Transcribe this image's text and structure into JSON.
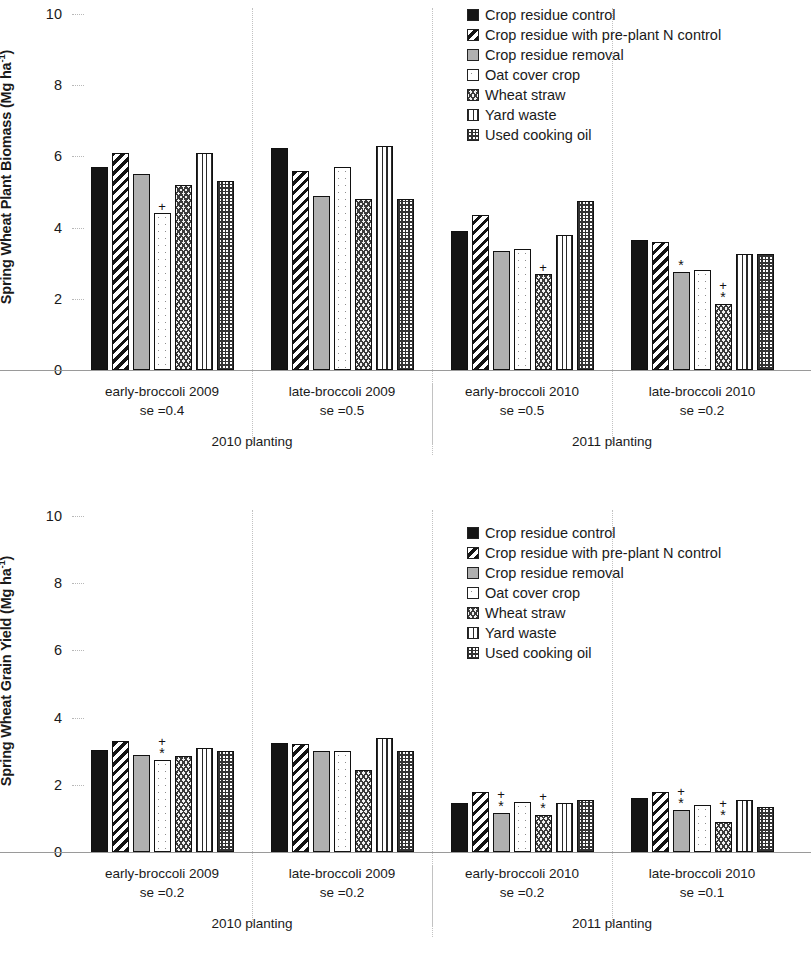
{
  "legend": {
    "items": [
      {
        "label": "Crop residue control",
        "pattern": "p-solid-black",
        "icon": "legend-swatch-solid-black"
      },
      {
        "label": "Crop residue with pre-plant N control",
        "pattern": "p-diag",
        "icon": "legend-swatch-diagonal-hatch"
      },
      {
        "label": "Crop residue removal",
        "pattern": "p-gray",
        "icon": "legend-swatch-solid-gray"
      },
      {
        "label": "Oat cover crop",
        "pattern": "p-open",
        "icon": "legend-swatch-open"
      },
      {
        "label": "Wheat straw",
        "pattern": "p-wave",
        "icon": "legend-swatch-wave"
      },
      {
        "label": "Yard waste",
        "pattern": "p-vert",
        "icon": "legend-swatch-vertical-lines"
      },
      {
        "label": "Used cooking oil",
        "pattern": "p-check",
        "icon": "legend-swatch-checkerboard"
      }
    ]
  },
  "charts": [
    {
      "id": "plant-biomass",
      "ylabel": "Spring Wheat Plant Biomass (Mg ha",
      "ylabel_sup": "-1",
      "ylabel_tail": ")",
      "yticks": [
        10,
        8,
        6,
        4,
        2,
        0
      ],
      "groups": [
        {
          "label": "early-broccoli 2009",
          "se": "se =0.4"
        },
        {
          "label": "late-broccoli 2009",
          "se": "se =0.5"
        },
        {
          "label": "early-broccoli 2010",
          "se": "se =0.5"
        },
        {
          "label": "late-broccoli 2010",
          "se": "se =0.2"
        }
      ],
      "seasons": [
        "2010 planting",
        "2011 planting"
      ]
    },
    {
      "id": "grain-yield",
      "ylabel": "Spring Wheat Grain Yield (Mg ha",
      "ylabel_sup": "-1",
      "ylabel_tail": ")",
      "yticks": [
        10,
        8,
        6,
        4,
        2,
        0
      ],
      "groups": [
        {
          "label": "early-broccoli 2009",
          "se": "se =0.2"
        },
        {
          "label": "late-broccoli 2009",
          "se": "se =0.2"
        },
        {
          "label": "early-broccoli 2010",
          "se": "se =0.2"
        },
        {
          "label": "late-broccoli 2010",
          "se": "se =0.1"
        }
      ],
      "seasons": [
        "2010 planting",
        "2011 planting"
      ]
    }
  ],
  "chart_data": [
    {
      "type": "bar",
      "title": "Spring Wheat Plant Biomass",
      "ylabel": "Spring Wheat Plant Biomass (Mg ha-1)",
      "xlabel": "",
      "ylim": [
        0,
        10
      ],
      "yticks": [
        0,
        2,
        4,
        6,
        8,
        10
      ],
      "grid": true,
      "legend_position": "top-right",
      "categories": [
        "early-broccoli 2009",
        "late-broccoli 2009",
        "early-broccoli 2010",
        "late-broccoli 2010"
      ],
      "category_se": [
        0.4,
        0.5,
        0.5,
        0.2
      ],
      "category_groups": [
        "2010 planting",
        "2010 planting",
        "2011 planting",
        "2011 planting"
      ],
      "series": [
        {
          "name": "Crop residue control",
          "values": [
            5.7,
            6.25,
            3.9,
            3.65
          ]
        },
        {
          "name": "Crop residue with pre-plant N control",
          "values": [
            6.1,
            5.6,
            4.35,
            3.6
          ]
        },
        {
          "name": "Crop residue removal",
          "values": [
            5.5,
            4.9,
            3.35,
            2.75
          ]
        },
        {
          "name": "Oat cover crop",
          "values": [
            4.4,
            5.7,
            3.4,
            2.8
          ]
        },
        {
          "name": "Wheat straw",
          "values": [
            5.2,
            4.8,
            2.7,
            1.85
          ]
        },
        {
          "name": "Yard waste",
          "values": [
            6.1,
            6.3,
            3.8,
            3.25
          ]
        },
        {
          "name": "Used cooking oil",
          "values": [
            5.3,
            4.8,
            4.75,
            3.25
          ]
        }
      ],
      "annotations": [
        {
          "category": "early-broccoli 2009",
          "series": "Oat cover crop",
          "marks": [
            "+"
          ]
        },
        {
          "category": "early-broccoli 2010",
          "series": "Wheat straw",
          "marks": [
            "+"
          ]
        },
        {
          "category": "late-broccoli 2010",
          "series": "Crop residue removal",
          "marks": [
            "*"
          ]
        },
        {
          "category": "late-broccoli 2010",
          "series": "Wheat straw",
          "marks": [
            "+",
            "*"
          ]
        }
      ]
    },
    {
      "type": "bar",
      "title": "Spring Wheat Grain Yield",
      "ylabel": "Spring Wheat Grain Yield (Mg ha-1)",
      "xlabel": "",
      "ylim": [
        0,
        10
      ],
      "yticks": [
        0,
        2,
        4,
        6,
        8,
        10
      ],
      "grid": true,
      "legend_position": "top-right",
      "categories": [
        "early-broccoli 2009",
        "late-broccoli 2009",
        "early-broccoli 2010",
        "late-broccoli 2010"
      ],
      "category_se": [
        0.2,
        0.2,
        0.2,
        0.1
      ],
      "category_groups": [
        "2010 planting",
        "2010 planting",
        "2011 planting",
        "2011 planting"
      ],
      "series": [
        {
          "name": "Crop residue control",
          "values": [
            3.05,
            3.25,
            1.45,
            1.6
          ]
        },
        {
          "name": "Crop residue with pre-plant N control",
          "values": [
            3.3,
            3.2,
            1.8,
            1.8
          ]
        },
        {
          "name": "Crop residue removal",
          "values": [
            2.9,
            3.0,
            1.15,
            1.25
          ]
        },
        {
          "name": "Oat cover crop",
          "values": [
            2.75,
            3.0,
            1.5,
            1.4
          ]
        },
        {
          "name": "Wheat straw",
          "values": [
            2.85,
            2.45,
            1.1,
            0.9
          ]
        },
        {
          "name": "Yard waste",
          "values": [
            3.1,
            3.4,
            1.45,
            1.55
          ]
        },
        {
          "name": "Used cooking oil",
          "values": [
            3.0,
            3.0,
            1.55,
            1.35
          ]
        }
      ],
      "annotations": [
        {
          "category": "early-broccoli 2009",
          "series": "Oat cover crop",
          "marks": [
            "+",
            "*"
          ]
        },
        {
          "category": "early-broccoli 2010",
          "series": "Crop residue removal",
          "marks": [
            "+",
            "*"
          ]
        },
        {
          "category": "early-broccoli 2010",
          "series": "Wheat straw",
          "marks": [
            "+",
            "*"
          ]
        },
        {
          "category": "late-broccoli 2010",
          "series": "Crop residue removal",
          "marks": [
            "+",
            "*"
          ]
        },
        {
          "category": "late-broccoli 2010",
          "series": "Wheat straw",
          "marks": [
            "+",
            "*"
          ]
        }
      ]
    }
  ]
}
